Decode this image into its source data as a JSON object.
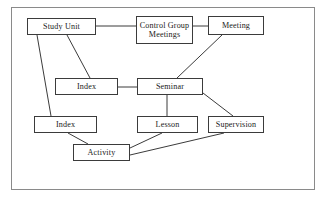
{
  "figure": {
    "kind": "node-link-diagram",
    "background_color": "#ffffff",
    "frame_border_color": "#8a8a8a",
    "node_border_color": "#3b3b3b",
    "node_fill_color": "#ffffff",
    "edge_color": "#3b3b3b",
    "text_color": "#1a1a1a"
  },
  "nodes": [
    {
      "id": "study-unit",
      "label": "Study Unit",
      "x": 27,
      "y": 18,
      "w": 69,
      "h": 17
    },
    {
      "id": "control-group",
      "label": "Control Group\nMeetings",
      "x": 136,
      "y": 16,
      "w": 57,
      "h": 28
    },
    {
      "id": "meeting",
      "label": "Meeting",
      "x": 208,
      "y": 16,
      "w": 56,
      "h": 19
    },
    {
      "id": "index-middle",
      "label": "Index",
      "x": 55,
      "y": 78,
      "w": 63,
      "h": 17
    },
    {
      "id": "seminar",
      "label": "Seminar",
      "x": 137,
      "y": 78,
      "w": 66,
      "h": 17
    },
    {
      "id": "index-lower",
      "label": "Index",
      "x": 34,
      "y": 116,
      "w": 63,
      "h": 17
    },
    {
      "id": "lesson",
      "label": "Lesson",
      "x": 137,
      "y": 116,
      "w": 61,
      "h": 17
    },
    {
      "id": "supervision",
      "label": "Supervision",
      "x": 208,
      "y": 116,
      "w": 56,
      "h": 17
    },
    {
      "id": "activity",
      "label": "Activity",
      "x": 73,
      "y": 144,
      "w": 57,
      "h": 17
    }
  ],
  "edges": [
    {
      "id": "study-unit--control-group",
      "from": "study-unit",
      "to": "control-group",
      "x1": 96,
      "y1": 26,
      "x2": 136,
      "y2": 26
    },
    {
      "id": "control-group--meeting",
      "from": "control-group",
      "to": "meeting",
      "x1": 193,
      "y1": 26,
      "x2": 208,
      "y2": 26
    },
    {
      "id": "meeting--seminar",
      "from": "meeting",
      "to": "seminar",
      "x1": 222,
      "y1": 35,
      "x2": 177,
      "y2": 78
    },
    {
      "id": "study-unit--index-middle",
      "from": "study-unit",
      "to": "index-middle",
      "x1": 67,
      "y1": 35,
      "x2": 90,
      "y2": 78
    },
    {
      "id": "study-unit--index-lower",
      "from": "study-unit",
      "to": "index-lower",
      "x1": 37,
      "y1": 35,
      "x2": 51,
      "y2": 116
    },
    {
      "id": "index-middle--seminar",
      "from": "index-middle",
      "to": "seminar",
      "x1": 118,
      "y1": 87,
      "x2": 137,
      "y2": 87
    },
    {
      "id": "seminar--lesson",
      "from": "seminar",
      "to": "lesson",
      "x1": 167,
      "y1": 95,
      "x2": 167,
      "y2": 116
    },
    {
      "id": "seminar--supervision",
      "from": "seminar",
      "to": "supervision",
      "x1": 203,
      "y1": 93,
      "x2": 233,
      "y2": 116
    },
    {
      "id": "index-lower--activity",
      "from": "index-lower",
      "to": "activity",
      "x1": 68,
      "y1": 133,
      "x2": 88,
      "y2": 144
    },
    {
      "id": "activity--lesson",
      "from": "activity",
      "to": "lesson",
      "x1": 130,
      "y1": 148,
      "x2": 162,
      "y2": 133
    },
    {
      "id": "activity--supervision",
      "from": "activity",
      "to": "supervision",
      "x1": 130,
      "y1": 155,
      "x2": 224,
      "y2": 133
    }
  ]
}
